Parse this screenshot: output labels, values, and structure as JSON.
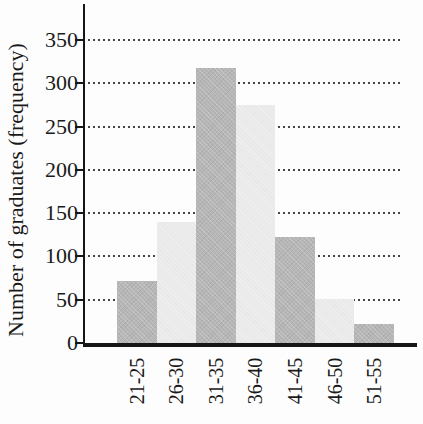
{
  "chart_data": {
    "type": "bar",
    "title": "",
    "xlabel": "",
    "ylabel": "Number of graduates (frequency)",
    "categories": [
      "21-25",
      "26-30",
      "31-35",
      "36-40",
      "41-45",
      "46-50",
      "51-55"
    ],
    "values": [
      72,
      140,
      318,
      275,
      122,
      51,
      22
    ],
    "yticks": [
      0,
      50,
      100,
      150,
      200,
      250,
      300,
      350
    ],
    "ylim": [
      0,
      390
    ],
    "grid": "horizontal-dotted",
    "legend": "none",
    "bar_color_pattern": "alternating-dark-light",
    "colors": {
      "dark_bar": "#b6b6b6",
      "light_bar": "#e9e9e9",
      "axis": "#161616",
      "grid_dot": "#454545",
      "text": "#1a1a1a"
    }
  }
}
